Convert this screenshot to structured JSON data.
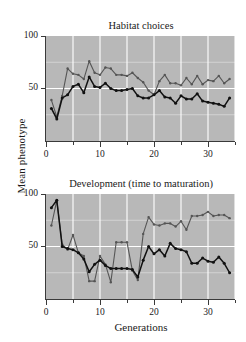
{
  "figure": {
    "y_axis_label": "Mean phenotype",
    "x_axis_label": "Generations",
    "background": "#ffffff",
    "plot_background": "#b8b8b8",
    "gridline_color": "#ffffff",
    "axis_color": "#3a3a3a"
  },
  "chart_data": [
    {
      "type": "line",
      "title": "Habitat choices",
      "xlabel": "Generations",
      "ylabel": "Mean phenotype",
      "xlim": [
        0,
        35
      ],
      "ylim": [
        0,
        100
      ],
      "xticks": [
        0,
        10,
        20,
        30
      ],
      "xticks_minor": [
        5,
        15,
        25,
        35
      ],
      "yticks": [
        50,
        100
      ],
      "grid": true,
      "legend": "none",
      "x": [
        1,
        2,
        3,
        4,
        5,
        6,
        7,
        8,
        9,
        10,
        11,
        12,
        13,
        14,
        15,
        16,
        17,
        18,
        19,
        20,
        21,
        22,
        23,
        24,
        25,
        26,
        27,
        28,
        29,
        30,
        31,
        32,
        33,
        34
      ],
      "series": [
        {
          "name": "series-gray",
          "color": "#555555",
          "marker": "circle",
          "values": [
            39,
            23,
            43,
            69,
            64,
            63,
            59,
            76,
            65,
            63,
            70,
            69,
            63,
            63,
            62,
            65,
            60,
            56,
            48,
            44,
            57,
            63,
            55,
            55,
            53,
            60,
            54,
            62,
            54,
            58,
            57,
            62,
            55,
            59
          ]
        },
        {
          "name": "series-black",
          "color": "#111111",
          "marker": "circle",
          "values": [
            31,
            21,
            41,
            44,
            52,
            54,
            46,
            61,
            52,
            51,
            55,
            50,
            48,
            48,
            49,
            50,
            43,
            41,
            41,
            44,
            48,
            42,
            41,
            36,
            43,
            40,
            40,
            45,
            38,
            37,
            36,
            35,
            33,
            41
          ]
        }
      ]
    },
    {
      "type": "line",
      "title": "Development (time to maturation)",
      "xlabel": "Generations",
      "ylabel": "Mean phenotype",
      "xlim": [
        0,
        35
      ],
      "ylim": [
        0,
        100
      ],
      "xticks": [
        0,
        10,
        20,
        30
      ],
      "xticks_minor": [
        5,
        15,
        25,
        35
      ],
      "yticks": [
        50,
        100
      ],
      "grid": true,
      "legend": "none",
      "x": [
        1,
        2,
        3,
        4,
        5,
        6,
        7,
        8,
        9,
        10,
        11,
        12,
        13,
        14,
        15,
        16,
        17,
        18,
        19,
        20,
        21,
        22,
        23,
        24,
        25,
        26,
        27,
        28,
        29,
        30,
        31,
        32,
        33,
        34
      ],
      "series": [
        {
          "name": "series-gray",
          "color": "#555555",
          "marker": "circle",
          "values": [
            70,
            94,
            52,
            47,
            61,
            44,
            41,
            17,
            17,
            41,
            33,
            16,
            54,
            54,
            54,
            27,
            18,
            62,
            78,
            71,
            70,
            72,
            72,
            69,
            74,
            66,
            79,
            79,
            80,
            83,
            79,
            80,
            80,
            77
          ]
        },
        {
          "name": "series-black",
          "color": "#111111",
          "marker": "circle",
          "values": [
            87,
            94,
            50,
            48,
            47,
            44,
            38,
            26,
            33,
            37,
            32,
            29,
            29,
            29,
            29,
            28,
            21,
            37,
            50,
            43,
            47,
            41,
            53,
            48,
            47,
            45,
            34,
            34,
            39,
            36,
            35,
            40,
            34,
            25
          ]
        }
      ]
    }
  ]
}
